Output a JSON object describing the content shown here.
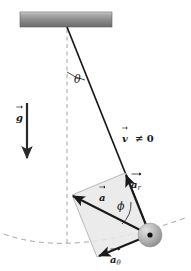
{
  "figure": {
    "background_color": "#ffffff",
    "width": 191,
    "height": 271
  },
  "labels": {
    "theta": "θ",
    "phi": "ϕ",
    "gravity": "g",
    "velocity": "v",
    "velocity_relation": "≠ 0",
    "acceleration": "a",
    "acceleration_radial": "a",
    "acceleration_radial_sub": "r",
    "acceleration_tangential": "a",
    "acceleration_tangential_sub": "θ"
  },
  "colors": {
    "line": "#1a1a1a",
    "dashed": "#9a9a9a",
    "parallelogram_fill": "#e6e6e6",
    "parallelogram_stroke": "#b5b5b5",
    "bob_light": "#d8d8d8",
    "bob_dark": "#8c8c8c",
    "ceiling_light": "#cfcfcf",
    "ceiling_dark": "#6e6e6e"
  },
  "elements": {
    "ceiling": {
      "x": 20,
      "y": 12,
      "width": 92,
      "height": 15
    },
    "pivot": {
      "x": 67,
      "y": 27
    },
    "bob": {
      "cx": 150,
      "cy": 235,
      "r": 12
    },
    "string": {
      "x1": 67,
      "y1": 27,
      "x2": 150,
      "y2": 235
    },
    "vertical_dashed": {
      "x1": 67,
      "y1": 30,
      "x2": 67,
      "y2": 246
    },
    "gravity_arrow": {
      "x1": 27,
      "y1": 104,
      "x2": 27,
      "y2": 160
    },
    "arc_path": "M 4 234 Q 70 258 188 218",
    "radial_vector": {
      "x1": 150,
      "y1": 235,
      "x2": 125,
      "y2": 173
    },
    "tangential_vector": {
      "x1": 150,
      "y1": 235,
      "x2": 97,
      "y2": 257
    },
    "resultant_vector": {
      "x1": 150,
      "y1": 235,
      "x2": 72,
      "y2": 195
    },
    "parallelogram_points": "125,173 150,235 97,257 72,195",
    "theta_arc": "M 67 73 A 47 47 0 0 1 85 81",
    "phi_arc": "M 120 222 A 26 26 0 0 0 128 200"
  }
}
